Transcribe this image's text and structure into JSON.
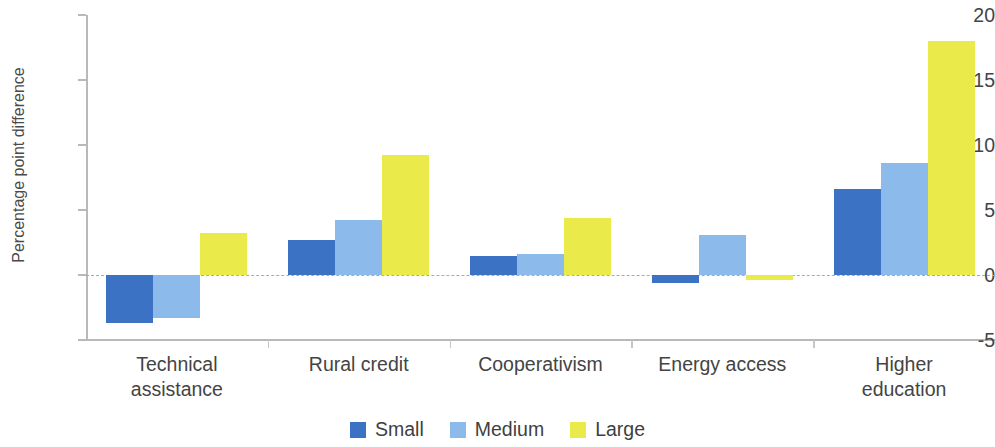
{
  "chart_data": {
    "type": "bar",
    "title": "",
    "subtitle": "",
    "xlabel": "",
    "ylabel": "Percentage point difference",
    "ylim": [
      -5,
      20
    ],
    "yticks": [
      20,
      15,
      10,
      5,
      0,
      -5
    ],
    "ytick_labels": [
      "20",
      "15",
      "10",
      "5",
      "0",
      "-5"
    ],
    "grid": false,
    "zero_line": true,
    "legend_position": "bottom-center",
    "orientation": "vertical",
    "grouping": "grouped",
    "categories": [
      "Technical\nassistance",
      "Rural credit",
      "Cooperativism",
      "Energy access",
      "Higher\neducation"
    ],
    "category_labels_flat": [
      "Technical assistance",
      "Rural credit",
      "Cooperativism",
      "Energy access",
      "Higher education"
    ],
    "series": [
      {
        "name": "Small",
        "color": "#3b72c4",
        "values": [
          -3.7,
          2.7,
          1.5,
          -0.6,
          6.6
        ]
      },
      {
        "name": "Medium",
        "color": "#8cbaea",
        "values": [
          -3.3,
          4.2,
          1.65,
          3.1,
          8.6
        ]
      },
      {
        "name": "Large",
        "color": "#eaea4a",
        "values": [
          3.2,
          9.2,
          4.35,
          -0.4,
          18.0
        ]
      }
    ]
  },
  "legend": {
    "items": [
      {
        "label": "Small",
        "color": "#3b72c4"
      },
      {
        "label": "Medium",
        "color": "#8cbaea"
      },
      {
        "label": "Large",
        "color": "#eaea4a"
      }
    ]
  },
  "axis": {
    "y_title": "Percentage point difference",
    "tick_0": "20",
    "tick_1": "15",
    "tick_2": "10",
    "tick_3": "5",
    "tick_4": "0",
    "tick_5": "-5"
  },
  "colors": {
    "small": "#3b72c4",
    "medium": "#8cbaea",
    "large": "#eaea4a",
    "axis": "#b9b9b9",
    "zero_line": "#a9a9b5",
    "text": "#444444",
    "background": "#ffffff"
  }
}
